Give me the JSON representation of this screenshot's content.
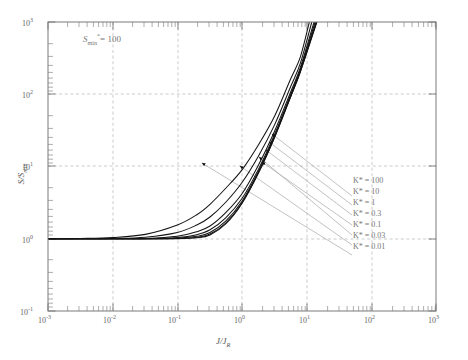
{
  "chart_data": {
    "type": "line",
    "title": "",
    "xlabel": "J/J_R",
    "ylabel": "S/S_min",
    "xscale": "log",
    "yscale": "log",
    "xlim": [
      0.001,
      1000
    ],
    "ylim": [
      0.1,
      1000
    ],
    "grid": true,
    "annotation": "S_min* = 100",
    "legend_position": "right-inline-leaders",
    "xticks": [
      "10^-3",
      "10^-2",
      "10^-1",
      "10^0",
      "10^1",
      "10^2",
      "10^3"
    ],
    "yticks": [
      "10^-1",
      "10^0",
      "10^1",
      "10^2",
      "10^3"
    ],
    "series": [
      {
        "name": "K* = 100",
        "x": [
          0.001,
          0.0032,
          0.01,
          0.032,
          0.1,
          0.2,
          0.32,
          0.56,
          1.0,
          1.8,
          3.2,
          5.6,
          8.0,
          11.0
        ],
        "y": [
          1.0,
          1.01,
          1.04,
          1.15,
          1.55,
          2.15,
          3.0,
          5.0,
          9.0,
          20.0,
          50.0,
          160.0,
          330.0,
          1000.0
        ]
      },
      {
        "name": "K* = 10",
        "x": [
          0.001,
          0.0032,
          0.01,
          0.032,
          0.1,
          0.2,
          0.32,
          0.56,
          1.0,
          1.8,
          3.2,
          5.6,
          8.0,
          12.0
        ],
        "y": [
          1.0,
          1.0,
          1.01,
          1.05,
          1.22,
          1.55,
          2.0,
          3.2,
          6.0,
          14.0,
          38.0,
          125.0,
          270.0,
          1000.0
        ]
      },
      {
        "name": "K* = 1",
        "x": [
          0.001,
          0.01,
          0.032,
          0.1,
          0.2,
          0.32,
          0.56,
          1.0,
          1.8,
          3.2,
          5.6,
          8.0,
          13.0
        ],
        "y": [
          1.0,
          1.0,
          1.01,
          1.08,
          1.25,
          1.5,
          2.3,
          4.2,
          10.5,
          31.0,
          105.0,
          235.0,
          1000.0
        ]
      },
      {
        "name": "K* = 0.3",
        "x": [
          0.001,
          0.01,
          0.032,
          0.1,
          0.2,
          0.32,
          0.56,
          1.0,
          1.8,
          3.2,
          5.6,
          8.0,
          13.5
        ],
        "y": [
          1.0,
          1.0,
          1.0,
          1.04,
          1.14,
          1.33,
          1.95,
          3.6,
          9.2,
          28.0,
          97.0,
          220.0,
          1000.0
        ]
      },
      {
        "name": "K* = 0.1",
        "x": [
          0.001,
          0.01,
          0.032,
          0.1,
          0.2,
          0.32,
          0.56,
          1.0,
          1.8,
          3.2,
          5.6,
          8.0,
          14.0
        ],
        "y": [
          1.0,
          1.0,
          1.0,
          1.02,
          1.08,
          1.22,
          1.75,
          3.3,
          8.6,
          26.5,
          93.0,
          212.0,
          1000.0
        ]
      },
      {
        "name": "K* = 0.03",
        "x": [
          0.001,
          0.01,
          0.032,
          0.1,
          0.2,
          0.32,
          0.56,
          1.0,
          1.8,
          3.2,
          5.6,
          8.0,
          14.2
        ],
        "y": [
          1.0,
          1.0,
          1.0,
          1.01,
          1.05,
          1.16,
          1.65,
          3.15,
          8.3,
          25.8,
          91.0,
          208.0,
          1000.0
        ]
      },
      {
        "name": "K* = 0.01",
        "x": [
          0.001,
          0.01,
          0.032,
          0.1,
          0.2,
          0.32,
          0.56,
          1.0,
          1.8,
          3.2,
          5.6,
          8.0,
          14.4
        ],
        "y": [
          1.0,
          1.0,
          1.0,
          1.0,
          1.03,
          1.13,
          1.6,
          3.08,
          8.1,
          25.4,
          90.0,
          205.0,
          1000.0
        ]
      }
    ],
    "leader_arrow_targets": [
      {
        "label": "K* = 100",
        "x": 0.42,
        "y": 11.5
      },
      {
        "label": "K* = 10",
        "x": 0.93,
        "y": 11.0
      },
      {
        "label": "K* = 1",
        "x": 1.5,
        "y": 14.0
      },
      {
        "label": "K* = 0.3",
        "x": 1.62,
        "y": 12.0
      },
      {
        "label": "K* = 0.1",
        "x": 1.72,
        "y": 17.0
      },
      {
        "label": "K* = 0.03",
        "x": 1.8,
        "y": 22.0
      },
      {
        "label": "K* = 0.01",
        "x": 1.88,
        "y": 29.0
      }
    ]
  },
  "axes": {
    "x_label_text": "J/J",
    "x_label_sub": "R",
    "y_label_text": "S/S",
    "y_label_sub": "min",
    "xtick_labels": [
      {
        "mantissa": "10",
        "exp": "-3"
      },
      {
        "mantissa": "10",
        "exp": "-2"
      },
      {
        "mantissa": "10",
        "exp": "-1"
      },
      {
        "mantissa": "10",
        "exp": "0"
      },
      {
        "mantissa": "10",
        "exp": "1"
      },
      {
        "mantissa": "10",
        "exp": "2"
      },
      {
        "mantissa": "10",
        "exp": "3"
      }
    ],
    "ytick_labels": [
      {
        "mantissa": "10",
        "exp": "3"
      },
      {
        "mantissa": "10",
        "exp": "2"
      },
      {
        "mantissa": "10",
        "exp": "1"
      },
      {
        "mantissa": "10",
        "exp": "0"
      },
      {
        "mantissa": "10",
        "exp": "-1"
      }
    ]
  },
  "annotation": {
    "symbol": "S",
    "sub": "min",
    "star": "*",
    "equals": "= 100",
    "full": "S_min* = 100"
  },
  "legend": {
    "items": [
      {
        "label": "K* = 100"
      },
      {
        "label": "K* = 10"
      },
      {
        "label": "K* = 1"
      },
      {
        "label": "K* = 0.3"
      },
      {
        "label": "K* = 0.1"
      },
      {
        "label": "K* = 0.03"
      },
      {
        "label": "K* = 0.01"
      }
    ]
  },
  "colors": {
    "curve": "#1a1a1a",
    "grid": "#b0b0b0",
    "frame": "#808080",
    "text": "#666666",
    "leader": "#999999"
  }
}
